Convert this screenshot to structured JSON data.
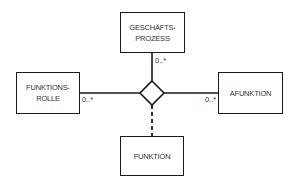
{
  "diagram": {
    "entities": {
      "top": {
        "line1": "GESCHÄFTS-",
        "line2": "PROZESS"
      },
      "left": {
        "line1": "FUNKTIONS-",
        "line2": "ROLLE"
      },
      "right": {
        "label": "AFUNKTION"
      },
      "bottom": {
        "label": "FUNKTION"
      }
    },
    "association": {
      "shape": "diamond",
      "bottom_link": "dashed"
    },
    "multiplicities": {
      "top": "0..*",
      "left": "0..*",
      "right": "0..*"
    }
  }
}
